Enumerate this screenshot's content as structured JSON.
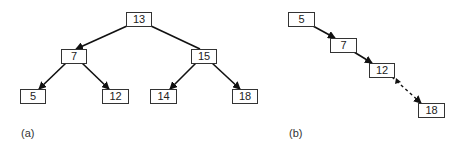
{
  "figure_a": {
    "label": "(a)",
    "nodes": [
      {
        "id": "a13",
        "value": "13",
        "x": 126,
        "y": 12,
        "w": 26,
        "h": 15
      },
      {
        "id": "a7",
        "value": "7",
        "x": 61,
        "y": 49,
        "w": 26,
        "h": 15
      },
      {
        "id": "a15",
        "value": "15",
        "x": 191,
        "y": 49,
        "w": 26,
        "h": 15
      },
      {
        "id": "a5",
        "value": "5",
        "x": 20,
        "y": 89,
        "w": 26,
        "h": 15
      },
      {
        "id": "a12",
        "value": "12",
        "x": 102,
        "y": 89,
        "w": 27,
        "h": 15
      },
      {
        "id": "a14",
        "value": "14",
        "x": 150,
        "y": 89,
        "w": 27,
        "h": 15
      },
      {
        "id": "a18",
        "value": "18",
        "x": 232,
        "y": 89,
        "w": 26,
        "h": 15
      }
    ],
    "edges": [
      {
        "from": "13",
        "to": "7",
        "style": "solid"
      },
      {
        "from": "13",
        "to": "15",
        "style": "solid"
      },
      {
        "from": "7",
        "to": "5",
        "style": "solid"
      },
      {
        "from": "7",
        "to": "12",
        "style": "solid"
      },
      {
        "from": "15",
        "to": "14",
        "style": "solid"
      },
      {
        "from": "15",
        "to": "18",
        "style": "solid"
      }
    ]
  },
  "figure_b": {
    "label": "(b)",
    "nodes": [
      {
        "id": "b5",
        "value": "5",
        "x": 288,
        "y": 12,
        "w": 27,
        "h": 15
      },
      {
        "id": "b7",
        "value": "7",
        "x": 330,
        "y": 38,
        "w": 27,
        "h": 15
      },
      {
        "id": "b12",
        "value": "12",
        "x": 369,
        "y": 63,
        "w": 26,
        "h": 15
      },
      {
        "id": "b18",
        "value": "18",
        "x": 418,
        "y": 103,
        "w": 27,
        "h": 15
      }
    ],
    "edges": [
      {
        "from": "5",
        "to": "7",
        "style": "solid"
      },
      {
        "from": "7",
        "to": "12",
        "style": "solid"
      },
      {
        "from": "12",
        "to": "18",
        "style": "dashed"
      }
    ]
  }
}
